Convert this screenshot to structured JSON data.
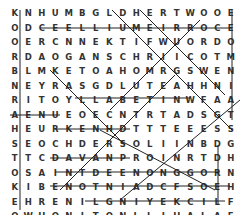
{
  "puzzle": {
    "type": "word-search",
    "rows": [
      "KNHUMBGLDHERTWOOE",
      "ODCEELLIUMEIRROCE",
      "OERCNNEKTIFWUORDO",
      "RDAOGANSCHRIICOTM",
      "BLMKETOAHOMRGSWEN",
      "NEYRASGDLUTEAHHNI",
      "RITOYLLABETINWFAA",
      "AENUEOECNTRTADSGT",
      "HEURKENHDTTTEEESS",
      "SEOCHDERSOLIINBDG",
      "TTCDAVANPROINRTDH",
      "OSAINTDEENONGGORN",
      "KIBENOTNIADCFSOEH",
      "EHRENILGNIYEKCILF",
      "OWHONITONLLIHALAF",
      "UREWWAPEAKFORESTI"
    ]
  }
}
